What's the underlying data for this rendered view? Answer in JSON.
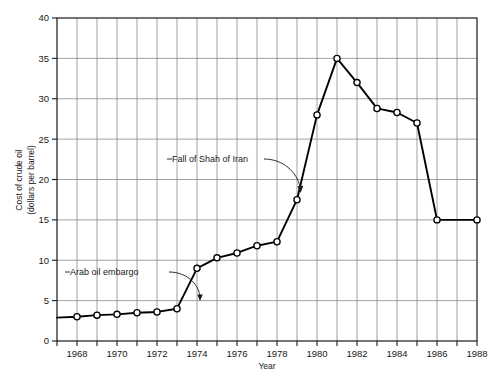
{
  "chart_data": {
    "type": "line",
    "title": "",
    "xlabel": "Year",
    "ylabel": "Cost of crude oil (dollars per barrel)",
    "ylabel_line1": "Cost of crude oil",
    "ylabel_line2": "(dollars per barrel)",
    "xlim": [
      1967,
      1988
    ],
    "ylim": [
      0,
      40
    ],
    "y_ticks": [
      0,
      5,
      10,
      15,
      20,
      25,
      30,
      35,
      40
    ],
    "y_tick_labels": [
      "0",
      "5",
      "10",
      "15",
      "20",
      "25",
      "30",
      "35",
      "40"
    ],
    "x_ticks": [
      1967,
      1968,
      1969,
      1970,
      1971,
      1972,
      1973,
      1974,
      1975,
      1976,
      1977,
      1978,
      1979,
      1980,
      1981,
      1982,
      1983,
      1984,
      1985,
      1986,
      1987,
      1988
    ],
    "x_tick_labels": [
      "1968",
      "1970",
      "1972",
      "1974",
      "1976",
      "1978",
      "1980",
      "1982",
      "1984",
      "1986",
      "1988"
    ],
    "x_labeled_ticks": [
      1968,
      1970,
      1972,
      1974,
      1976,
      1978,
      1980,
      1982,
      1984,
      1986,
      1988
    ],
    "grid": true,
    "legend": "none",
    "marker": "open-circle",
    "line_color": "#000000",
    "grid_color": "#8a8a8a",
    "axis_color": "#1a1a1a",
    "x": [
      1967,
      1968,
      1969,
      1970,
      1971,
      1972,
      1973,
      1974,
      1975,
      1976,
      1977,
      1978,
      1979,
      1980,
      1981,
      1982,
      1983,
      1984,
      1985,
      1986,
      1988
    ],
    "values": [
      2.9,
      3.0,
      3.2,
      3.3,
      3.5,
      3.6,
      4.0,
      9.0,
      10.3,
      10.9,
      11.8,
      12.3,
      17.5,
      28.0,
      35.0,
      32.0,
      28.8,
      28.3,
      27.0,
      15.0,
      15.0
    ],
    "annotations": [
      {
        "id": "arab-oil-embargo",
        "text": "Arab oil embargo",
        "target_x": 1973,
        "target_y": 4.0
      },
      {
        "id": "fall-of-shah-of-iran",
        "text": "Fall of Shah of Iran",
        "target_x": 1979,
        "target_y": 17.5
      }
    ]
  }
}
